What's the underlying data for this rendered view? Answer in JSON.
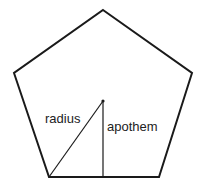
{
  "diagram": {
    "labels": {
      "radius": "radius",
      "apothem": "apothem"
    },
    "colors": {
      "stroke": "#1a1a1a",
      "background": "#ffffff",
      "text": "#222222"
    },
    "shape": {
      "type": "regular-pentagon",
      "vertices": [
        [
          103,
          10
        ],
        [
          192,
          73
        ],
        [
          159,
          177
        ],
        [
          49,
          177
        ],
        [
          14,
          73
        ]
      ],
      "center": [
        103,
        101
      ]
    },
    "segments": {
      "radius": {
        "from": [
          103,
          101
        ],
        "to": [
          49,
          177
        ]
      },
      "apothem": {
        "from": [
          103,
          101
        ],
        "to": [
          103,
          177
        ]
      }
    }
  }
}
